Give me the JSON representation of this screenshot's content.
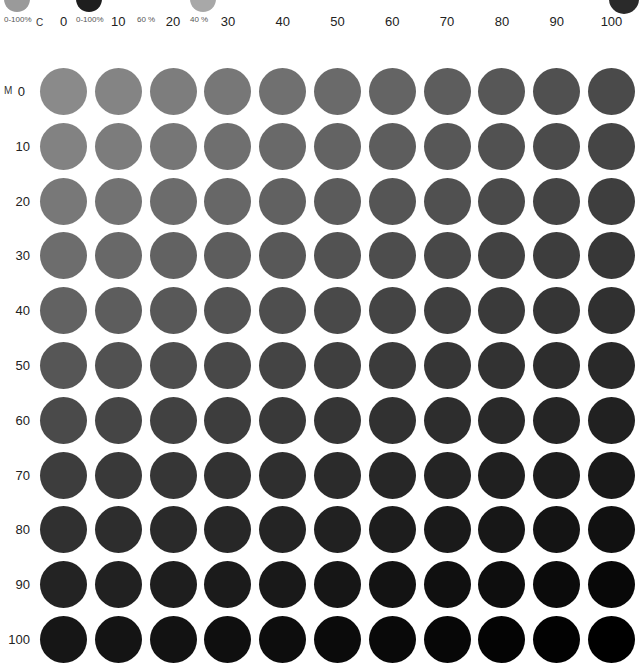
{
  "legend": {
    "swatches": [
      {
        "caption": "0-100%",
        "color": "#9a9a9a",
        "x": 4,
        "w": 26
      },
      {
        "caption": "0-100%",
        "color": "#1e1e1e",
        "x": 76,
        "w": 26
      },
      {
        "caption": "60 %",
        "color": "#ffffff",
        "x": 137,
        "w": 0
      },
      {
        "caption": "40 %",
        "color": "#a8a8a8",
        "x": 190,
        "w": 26
      }
    ],
    "corner_swatch_color": "#2a2a2a"
  },
  "axes": {
    "column_axis": "C",
    "row_axis": "M"
  },
  "chart_data": {
    "type": "heatmap",
    "title": "",
    "xlabel": "C",
    "ylabel": "M",
    "x": [
      0,
      10,
      20,
      30,
      40,
      50,
      60,
      70,
      80,
      90,
      100
    ],
    "y": [
      0,
      10,
      20,
      30,
      40,
      50,
      60,
      70,
      80,
      90,
      100
    ],
    "cell_shape": "circle",
    "corner_colors": {
      "c0_m0": "#8a8a8a",
      "c100_m0": "#4a4a4a",
      "c0_m100": "#161616",
      "c100_m100": "#000000"
    },
    "legend": [
      "0-100%",
      "0-100%",
      "60 %",
      "40 %"
    ]
  },
  "grid": {
    "col_labels": [
      "0",
      "10",
      "20",
      "30",
      "40",
      "50",
      "60",
      "70",
      "80",
      "90",
      "100"
    ],
    "row_labels": [
      "0",
      "10",
      "20",
      "30",
      "40",
      "50",
      "60",
      "70",
      "80",
      "90",
      "100"
    ]
  }
}
